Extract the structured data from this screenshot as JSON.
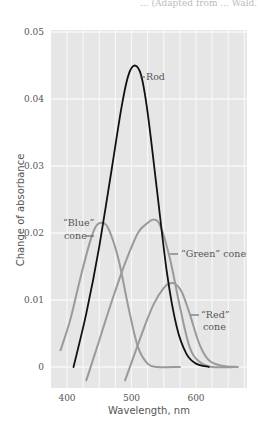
{
  "caption_partial": "... (Adapted from ... Wald.)",
  "chart_data": {
    "type": "line",
    "title": "",
    "xlabel": "Wavelength, nm",
    "ylabel": "Change of absorbance",
    "xlim": [
      375,
      680
    ],
    "ylim": [
      -0.003,
      0.05
    ],
    "x_ticks": [
      400,
      500,
      600
    ],
    "y_ticks": [
      0,
      0.01,
      0.02,
      0.03,
      0.04,
      0.05
    ],
    "y_tick_labels": [
      "0",
      "0.01",
      "0.02",
      "0.03",
      "0.04",
      "0.05"
    ],
    "grid": true,
    "legend": "inline annotations",
    "series": [
      {
        "name": "Rod",
        "label": "Rod",
        "color": "#111111",
        "peak_nm": 505,
        "peak_value": 0.045,
        "x": [
          410,
          430,
          450,
          470,
          485,
          495,
          505,
          515,
          525,
          540,
          555,
          570,
          585,
          600,
          620
        ],
        "values": [
          0.0,
          0.008,
          0.018,
          0.03,
          0.039,
          0.0435,
          0.045,
          0.0435,
          0.038,
          0.026,
          0.014,
          0.006,
          0.002,
          0.0005,
          0.0
        ]
      },
      {
        "name": "Blue cone",
        "label": "“Blue” cone",
        "color": "#9a9a9a",
        "peak_nm": 455,
        "peak_value": 0.0215,
        "x": [
          390,
          405,
          420,
          435,
          445,
          455,
          465,
          480,
          495,
          510,
          525,
          540,
          575
        ],
        "values": [
          0.0025,
          0.007,
          0.013,
          0.0185,
          0.021,
          0.0215,
          0.0205,
          0.016,
          0.009,
          0.003,
          0.0005,
          0.0,
          0.0
        ]
      },
      {
        "name": "Green cone",
        "label": "“Green” cone",
        "color": "#9a9a9a",
        "peak_nm": 533,
        "peak_value": 0.022,
        "x": [
          430,
          450,
          470,
          490,
          510,
          525,
          535,
          545,
          560,
          575,
          590,
          605,
          625,
          660
        ],
        "values": [
          -0.002,
          0.004,
          0.01,
          0.0155,
          0.02,
          0.0215,
          0.022,
          0.021,
          0.016,
          0.009,
          0.003,
          0.0008,
          0.0,
          0.0
        ]
      },
      {
        "name": "Red cone",
        "label": "“Red” cone",
        "color": "#9a9a9a",
        "peak_nm": 565,
        "peak_value": 0.0125,
        "x": [
          490,
          505,
          520,
          535,
          550,
          560,
          568,
          578,
          590,
          605,
          620,
          640,
          665
        ],
        "values": [
          -0.002,
          0.002,
          0.006,
          0.0095,
          0.0118,
          0.0125,
          0.0124,
          0.0112,
          0.008,
          0.0035,
          0.001,
          0.0002,
          0.0
        ]
      }
    ],
    "annotations": [
      {
        "text": "Rod",
        "series": "Rod"
      },
      {
        "text": "“Blue”",
        "text2": "cone",
        "series": "Blue cone"
      },
      {
        "text": "“Green” cone",
        "series": "Green cone"
      },
      {
        "text": "“Red”",
        "text2": "cone",
        "series": "Red cone"
      }
    ]
  },
  "colors": {
    "plot_bg": "#e6e6e6",
    "grid": "#f7f7f7",
    "rod": "#111111",
    "cone": "#9a9a9a"
  }
}
